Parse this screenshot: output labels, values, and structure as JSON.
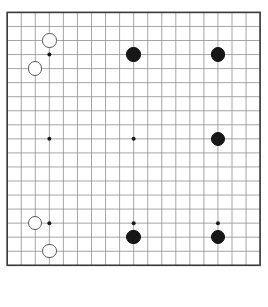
{
  "app": {
    "title": "Go Board",
    "type": "go-board-diagram"
  },
  "board": {
    "size": 19,
    "columns": 19,
    "rows": 19,
    "origin_x": 7.2,
    "origin_y": 12.4,
    "spacing": 14.05,
    "line_color": "#8f8f8f",
    "border_color": "#3a3a3a",
    "background_color": "#ffffff",
    "star_point_color": "#1a1a1a",
    "star_point_radius": 2.0,
    "star_points": [
      [
        3,
        3
      ],
      [
        9,
        3
      ],
      [
        15,
        3
      ],
      [
        3,
        9
      ],
      [
        9,
        9
      ],
      [
        15,
        9
      ],
      [
        3,
        15
      ],
      [
        9,
        15
      ],
      [
        15,
        15
      ]
    ]
  },
  "stones": {
    "black_color": "#171717",
    "white_color": "#ffffff",
    "white_outline_color": "#565656",
    "radius": 7.2,
    "black_count": 5,
    "white_count": 4,
    "items": [
      {
        "color": "black",
        "col": 9,
        "row": 3,
        "label": "black-stone-k16"
      },
      {
        "color": "black",
        "col": 15,
        "row": 3,
        "label": "black-stone-q16"
      },
      {
        "color": "black",
        "col": 15,
        "row": 9,
        "label": "black-stone-q10"
      },
      {
        "color": "black",
        "col": 9,
        "row": 16,
        "label": "black-stone-k3"
      },
      {
        "color": "black",
        "col": 15,
        "row": 16,
        "label": "black-stone-q3"
      },
      {
        "color": "white",
        "col": 3,
        "row": 2,
        "label": "white-stone-d17"
      },
      {
        "color": "white",
        "col": 2,
        "row": 4,
        "label": "white-stone-c15"
      },
      {
        "color": "white",
        "col": 2,
        "row": 15,
        "label": "white-stone-c4"
      },
      {
        "color": "white",
        "col": 3,
        "row": 17,
        "label": "white-stone-d2"
      }
    ]
  }
}
